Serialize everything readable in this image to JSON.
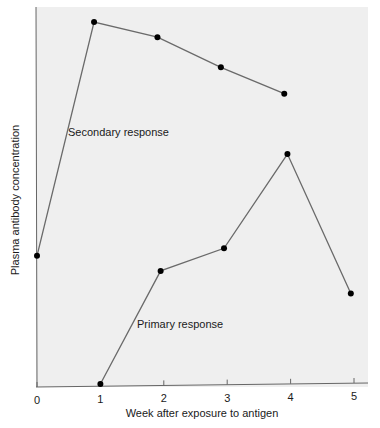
{
  "chart_data": {
    "type": "line",
    "title": "",
    "xlabel": "Week after exposure to antigen",
    "ylabel": "Plasma antibody concentration",
    "x_ticks": [
      "0",
      "1",
      "2",
      "3",
      "4",
      "5"
    ],
    "xlim": [
      0,
      5
    ],
    "ylim": [
      0,
      100
    ],
    "grid": false,
    "legend": "none (inline annotations)",
    "series": [
      {
        "name": "Secondary response",
        "x": [
          0,
          0.9,
          1.9,
          2.9,
          3.9
        ],
        "y": [
          34,
          96,
          92,
          84,
          77
        ]
      },
      {
        "name": "Primary response",
        "x": [
          1,
          1.95,
          2.95,
          3.95,
          4.95
        ],
        "y": [
          0,
          30,
          36,
          61,
          24
        ]
      }
    ],
    "annotations": [
      {
        "text": "Secondary response",
        "near": "secondary series, week ~1.1"
      },
      {
        "text": "Primary response",
        "near": "primary series, week ~1.6"
      }
    ]
  },
  "labels": {
    "secondary": "Secondary response",
    "primary": "Primary response",
    "xlabel": "Week after exposure to antigen",
    "ylabel": "Plasma antibody concentration"
  }
}
